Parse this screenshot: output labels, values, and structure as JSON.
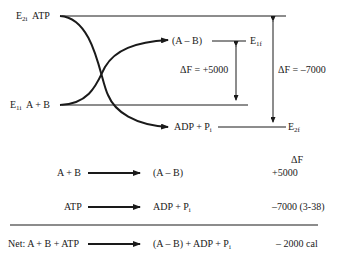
{
  "diagram": {
    "levels": {
      "e2i": {
        "symbol": "E",
        "sub": "2i",
        "species": "ATP"
      },
      "e1i": {
        "symbol": "E",
        "sub": "1i",
        "species": "A + B"
      },
      "e1f": {
        "symbol": "E",
        "sub": "1f",
        "species": "(A – B)"
      },
      "e2f": {
        "symbol": "E",
        "sub": "2f",
        "species_main": "ADP + P",
        "species_sub": "i"
      }
    },
    "arrows": {
      "df1": "ΔF = +5000",
      "df2": "ΔF = –7000"
    }
  },
  "table": {
    "header": "ΔF",
    "rows": [
      {
        "left": "A + B",
        "right": "(A – B)",
        "value": "+5000"
      },
      {
        "left": "ATP",
        "right_main": "ADP + P",
        "right_sub": "i",
        "value": "–7000 (3-38)"
      }
    ],
    "net": {
      "left": "Net: A + B + ATP",
      "right_main": "(A – B) + ADP + P",
      "right_sub": "i",
      "value": "– 2000 cal"
    }
  }
}
